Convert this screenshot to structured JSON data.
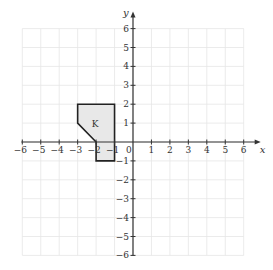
{
  "diagram": {
    "type": "coordinate-grid",
    "x_axis": {
      "label": "x",
      "min": -6,
      "max": 6,
      "ticks": [
        "-6",
        "-5",
        "-4",
        "-3",
        "-2",
        "-1",
        "1",
        "2",
        "3",
        "4",
        "5",
        "6"
      ]
    },
    "y_axis": {
      "label": "y",
      "min": -6,
      "max": 6,
      "ticks": [
        "-6",
        "-5",
        "-4",
        "-3",
        "-2",
        "-1",
        "1",
        "2",
        "3",
        "4",
        "5",
        "6"
      ]
    },
    "origin_label": "0",
    "shape": {
      "label": "K",
      "vertices": [
        [
          -3,
          2
        ],
        [
          -1,
          2
        ],
        [
          -1,
          -1
        ],
        [
          -2,
          -1
        ],
        [
          -2,
          0
        ],
        [
          -3,
          1
        ]
      ],
      "fill": "#e8e8e8",
      "stroke": "#222222"
    },
    "grid_color": "#e6e6e6",
    "axis_color": "#333333"
  }
}
